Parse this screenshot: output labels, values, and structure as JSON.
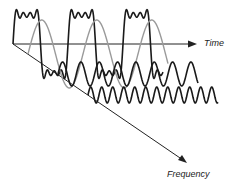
{
  "diagram": {
    "type": "time-frequency decomposition of a square wave",
    "axes": {
      "time": {
        "label": "Time"
      },
      "frequency": {
        "label": "Frequency"
      }
    },
    "colors": {
      "square_wave": "#1a1a1a",
      "fundamental": "#9a9a9a",
      "harmonics": "#1a1a1a",
      "axis": "#222222"
    }
  }
}
